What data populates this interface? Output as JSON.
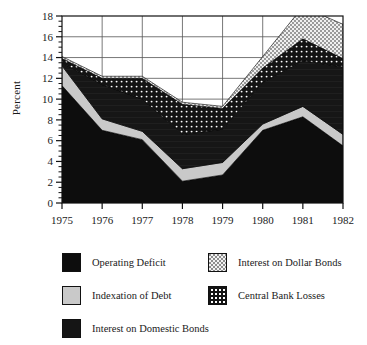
{
  "chart_data": {
    "type": "area",
    "title": "",
    "subtitle": "",
    "xlabel": "",
    "ylabel": "Percent",
    "grid": true,
    "legend_position": "bottom",
    "stacked": true,
    "x": [
      1975,
      1976,
      1977,
      1978,
      1979,
      1980,
      1981,
      1982
    ],
    "categories": [
      "1975",
      "1976",
      "1977",
      "1978",
      "1979",
      "1980",
      "1981",
      "1982"
    ],
    "xlim": [
      1975,
      1982
    ],
    "ylim": [
      0,
      18
    ],
    "ytick_labels": [
      "0",
      "2",
      "4",
      "6",
      "8",
      "10",
      "12",
      "14",
      "16",
      "18"
    ],
    "ytick_values": [
      0,
      2,
      4,
      6,
      8,
      10,
      12,
      14,
      16,
      18
    ],
    "xtick_labels": [
      "1975",
      "1976",
      "1977",
      "1978",
      "1979",
      "1980",
      "1981",
      "1982"
    ],
    "series": [
      {
        "name": "Operating Deficit",
        "color": "#0d0d0d",
        "pattern": "solid",
        "values": [
          11.3,
          7.0,
          6.1,
          2.1,
          2.7,
          7.0,
          8.3,
          5.5
        ]
      },
      {
        "name": "Indexation of Debt",
        "color": "#c9c9c9",
        "pattern": "solid-light",
        "values": [
          1.9,
          1.1,
          0.8,
          1.2,
          1.2,
          0.6,
          1.0,
          1.1
        ]
      },
      {
        "name": "Interest on Domestic Bonds",
        "color": "#151515",
        "pattern": "solid-dark",
        "values": [
          0.3,
          3.3,
          3.1,
          3.3,
          3.2,
          4.0,
          4.4,
          6.5
        ]
      },
      {
        "name": "Central Bank Losses",
        "color": "#141414",
        "pattern": "dots",
        "values": [
          0.4,
          0.6,
          2.0,
          2.9,
          2.0,
          1.4,
          2.1,
          0.8
        ]
      },
      {
        "name": "Interest on Dollar Bonds",
        "color": "#8d8d8d",
        "pattern": "checker",
        "values": [
          0.2,
          0.2,
          0.2,
          0.2,
          0.2,
          1.1,
          3.1,
          3.3
        ]
      }
    ],
    "stack_totals": [
      14.1,
      12.2,
      12.2,
      9.7,
      9.3,
      14.1,
      18.9,
      17.2
    ]
  },
  "axis": {
    "ylabel": "Percent"
  },
  "legend": {
    "items": [
      {
        "label": "Operating Deficit",
        "swatch": "sw-operating",
        "icon": "legend-swatch-operating-deficit"
      },
      {
        "label": "Indexation of Debt",
        "swatch": "sw-indexation",
        "icon": "legend-swatch-indexation-of-debt"
      },
      {
        "label": "Interest on Domestic Bonds",
        "swatch": "sw-domestic",
        "icon": "legend-swatch-interest-domestic-bonds"
      },
      {
        "label": "Interest on Dollar Bonds",
        "swatch": "sw-dollar",
        "icon": "legend-swatch-interest-dollar-bonds"
      },
      {
        "label": "Central Bank Losses",
        "swatch": "sw-central",
        "icon": "legend-swatch-central-bank-losses"
      }
    ]
  }
}
